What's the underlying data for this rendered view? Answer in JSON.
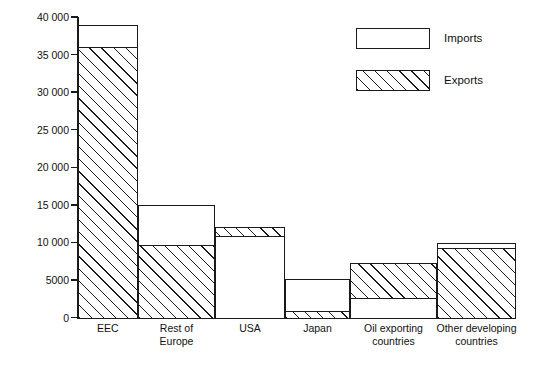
{
  "chart_data": {
    "type": "bar",
    "title": "",
    "subtitle": "",
    "xlabel": "",
    "ylabel": "",
    "ylim": [
      0,
      40000
    ],
    "yticks": [
      "0",
      "5000",
      "10 000",
      "15 000",
      "20 000",
      "25 000",
      "30 000",
      "35 000",
      "40 000"
    ],
    "ytick_values": [
      0,
      5000,
      10000,
      15000,
      20000,
      25000,
      30000,
      35000,
      40000
    ],
    "grid": false,
    "legend_position": "top-right",
    "categories": [
      "EEC",
      "Rest of\nEurope",
      "USA",
      "Japan",
      "Oil exporting\ncountries",
      "Other developing\ncountries"
    ],
    "series": [
      {
        "name": "Imports",
        "style": "open",
        "values": [
          39000,
          15000,
          10800,
          5200,
          2600,
          9900
        ]
      },
      {
        "name": "Exports",
        "style": "hatched",
        "values": [
          36000,
          9700,
          12000,
          900,
          7300,
          9300
        ]
      }
    ],
    "annotations": []
  },
  "legend": {
    "items": [
      {
        "label": "Imports",
        "style": "imports"
      },
      {
        "label": "Exports",
        "style": "exports"
      }
    ]
  },
  "colors": {
    "ink": "#1a1a1a",
    "background": "#ffffff"
  }
}
